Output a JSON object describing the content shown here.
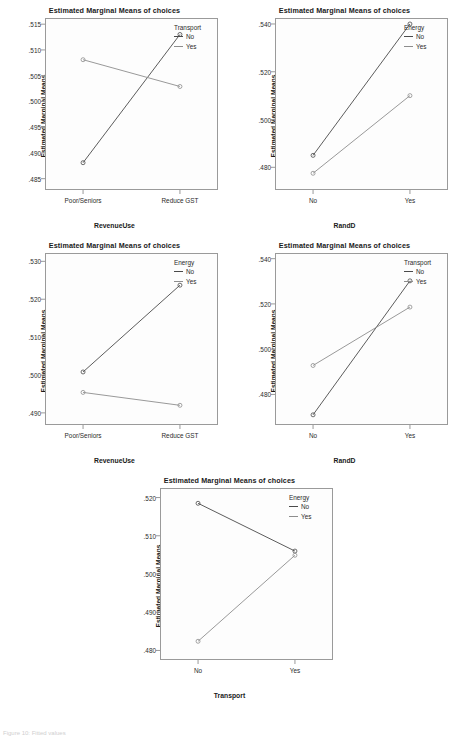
{
  "figure": {
    "width": 459,
    "height": 735,
    "background": "#ffffff",
    "series_colors": {
      "no": "#4a4a4a",
      "yes": "#8d8d8d"
    }
  },
  "chart_data": [
    {
      "id": "chart-1",
      "type": "line",
      "title": "Estimated Marginal Means of choices",
      "xlabel": "RevenueUse",
      "ylabel": "Estimated Marginal Means",
      "categories": [
        "Poor/Seniors",
        "Reduce GST"
      ],
      "yticks": [
        ".515",
        ".510",
        ".505",
        ".500",
        ".495",
        ".490",
        ".485"
      ],
      "ytickvals": [
        0.515,
        0.51,
        0.505,
        0.5,
        0.495,
        0.49,
        0.485
      ],
      "ylim": [
        0.4828,
        0.5162
      ],
      "legend_title": "Transport",
      "legend_position": "top-right-inside",
      "grid": false,
      "series": [
        {
          "name": "No",
          "values": [
            0.4881,
            0.513
          ]
        },
        {
          "name": "Yes",
          "values": [
            0.5081,
            0.5029
          ]
        }
      ]
    },
    {
      "id": "chart-2",
      "type": "line",
      "title": "Estimated Marginal Means of choices",
      "xlabel": "RandD",
      "ylabel": "Estimated Marginal Means",
      "categories": [
        "No",
        "Yes"
      ],
      "yticks": [
        ".540",
        ".520",
        ".500",
        ".480"
      ],
      "ytickvals": [
        0.54,
        0.52,
        0.5,
        0.48
      ],
      "ylim": [
        0.4705,
        0.5425
      ],
      "legend_title": "Energy",
      "legend_position": "top-right-inside",
      "grid": false,
      "series": [
        {
          "name": "No",
          "values": [
            0.485,
            0.54
          ]
        },
        {
          "name": "Yes",
          "values": [
            0.4775,
            0.51
          ]
        }
      ]
    },
    {
      "id": "chart-3",
      "type": "line",
      "title": "Estimated Marginal Means of choices",
      "xlabel": "RevenueUse",
      "ylabel": "Estimated Marginal Means",
      "categories": [
        "Poor/Seniors",
        "Reduce GST"
      ],
      "yticks": [
        ".530",
        ".520",
        ".510",
        ".500",
        ".490"
      ],
      "ytickvals": [
        0.53,
        0.52,
        0.51,
        0.5,
        0.49
      ],
      "ylim": [
        0.4868,
        0.5322
      ],
      "legend_title": "Energy",
      "legend_position": "top-right-inside",
      "grid": false,
      "series": [
        {
          "name": "No",
          "values": [
            0.5008,
            0.5237
          ]
        },
        {
          "name": "Yes",
          "values": [
            0.4954,
            0.492
          ]
        }
      ]
    },
    {
      "id": "chart-4",
      "type": "line",
      "title": "Estimated Marginal Means of choices",
      "xlabel": "RandD",
      "ylabel": "Estimated Marginal Means",
      "categories": [
        "No",
        "Yes"
      ],
      "yticks": [
        ".540",
        ".520",
        ".500",
        ".480"
      ],
      "ytickvals": [
        0.54,
        0.52,
        0.5,
        0.48
      ],
      "ylim": [
        0.4665,
        0.5425
      ],
      "legend_title": "Transport",
      "legend_position": "top-right-inside",
      "grid": false,
      "series": [
        {
          "name": "No",
          "values": [
            0.471,
            0.5302
          ]
        },
        {
          "name": "Yes",
          "values": [
            0.4928,
            0.5186
          ]
        }
      ]
    },
    {
      "id": "chart-5",
      "type": "line",
      "title": "Estimated Marginal Means of choices",
      "xlabel": "Transport",
      "ylabel": "Estimated Marginal Means",
      "categories": [
        "No",
        "Yes"
      ],
      "yticks": [
        ".520",
        ".510",
        ".500",
        ".490",
        ".480"
      ],
      "ytickvals": [
        0.52,
        0.51,
        0.5,
        0.49,
        0.48
      ],
      "ylim": [
        0.4775,
        0.5225
      ],
      "legend_title": "Energy",
      "legend_position": "top-right-inside",
      "grid": false,
      "series": [
        {
          "name": "No",
          "values": [
            0.5185,
            0.506
          ]
        },
        {
          "name": "Yes",
          "values": [
            0.4824,
            0.5049
          ]
        }
      ]
    }
  ],
  "footnote": {
    "text": "Figure 10: Fitted values"
  }
}
